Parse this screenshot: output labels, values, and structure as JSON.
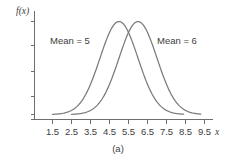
{
  "figure": {
    "caption": "(a)",
    "background_color": "#ffffff",
    "curve_color": "#7a7a7a",
    "axis_color": "#6e6e6e",
    "text_color": "#3c3c3c"
  },
  "axes": {
    "y_axis_title": "f(x)",
    "x_axis_title": "x",
    "x_tick_labels": [
      "1.5",
      "2.5",
      "3.5",
      "4.5",
      "5.5",
      "6.5",
      "7.5",
      "8.5",
      "9.5"
    ],
    "y_tick_labels": [
      "",
      "",
      "",
      ""
    ]
  },
  "annotations": {
    "left_curve_label": "Mean = 5",
    "right_curve_label": "Mean = 6"
  },
  "chart_data": {
    "type": "line",
    "title": "",
    "subtitle": "",
    "xlabel": "x",
    "ylabel": "f(x)",
    "xlim": [
      1.0,
      10.0
    ],
    "ylim": [
      0,
      0.45
    ],
    "grid": false,
    "legend": "inline-annotations",
    "x_ticks": [
      1.5,
      2.5,
      3.5,
      4.5,
      5.5,
      6.5,
      7.5,
      8.5,
      9.5
    ],
    "y_ticks": [
      0.0,
      0.125,
      0.25,
      0.375
    ],
    "annotations": [
      {
        "text": "Mean = 5",
        "x": 3.0,
        "y": 0.335
      },
      {
        "text": "Mean = 6",
        "x": 8.0,
        "y": 0.335
      }
    ],
    "series": [
      {
        "name": "Mean = 5",
        "distribution": "normal",
        "mean": 5,
        "std": 1,
        "x_range": [
          1.5,
          8.4
        ],
        "peak_value": 0.399,
        "x": [
          1.5,
          2.0,
          2.5,
          3.0,
          3.5,
          4.0,
          4.5,
          5.0,
          5.5,
          6.0,
          6.5,
          7.0,
          7.5,
          8.0,
          8.4
        ],
        "values": [
          0.009,
          0.044,
          0.018,
          0.054,
          0.13,
          0.242,
          0.352,
          0.399,
          0.352,
          0.242,
          0.13,
          0.054,
          0.018,
          0.004,
          0.001
        ]
      },
      {
        "name": "Mean = 6",
        "distribution": "normal",
        "mean": 6,
        "std": 1,
        "x_range": [
          2.5,
          9.3
        ],
        "peak_value": 0.399,
        "x": [
          2.5,
          3.0,
          3.5,
          4.0,
          4.5,
          5.0,
          5.5,
          6.0,
          6.5,
          7.0,
          7.5,
          8.0,
          8.5,
          9.0,
          9.3
        ],
        "values": [
          0.004,
          0.018,
          0.054,
          0.13,
          0.242,
          0.352,
          0.399,
          0.399,
          0.352,
          0.242,
          0.13,
          0.054,
          0.018,
          0.004,
          0.001
        ]
      }
    ]
  }
}
